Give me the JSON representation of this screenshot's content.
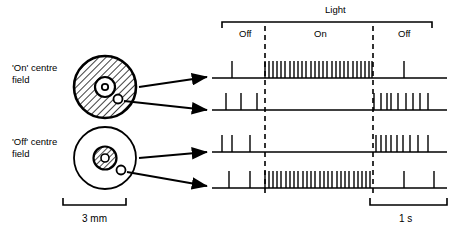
{
  "figure": {
    "title_label": "Light",
    "phases": [
      {
        "name": "off-before",
        "label": "Off",
        "x_start": 222,
        "x_end": 265
      },
      {
        "name": "on",
        "label": "On",
        "x_start": 265,
        "x_end": 373
      },
      {
        "name": "off-after",
        "label": "Off",
        "x_start": 373,
        "x_end": 432
      }
    ],
    "receptive_fields": [
      {
        "name": "on-centre",
        "label": "'On' centre\nfield",
        "centre_type": "on",
        "cx": 105,
        "cy": 87,
        "outer_r": 31,
        "inner_r": 10,
        "surround_fill": "hatched",
        "centre_fill": "white",
        "electrode_dot": {
          "cx": 118,
          "cy": 99,
          "r": 4.5
        }
      },
      {
        "name": "off-centre",
        "label": "'Off' centre\nfield",
        "centre_type": "off",
        "cx": 105,
        "cy": 158,
        "outer_r": 31,
        "inner_r": 11,
        "surround_fill": "white",
        "centre_fill": "hatched",
        "electrode_dot": {
          "cx": 121,
          "cy": 170,
          "r": 4.5
        }
      }
    ],
    "scale_bars": [
      {
        "name": "spatial-scale",
        "label": "3 mm",
        "x1": 63,
        "x2": 126,
        "y": 205
      },
      {
        "name": "time-scale",
        "label": "1 s",
        "x1": 370,
        "x2": 447,
        "y": 205
      }
    ],
    "traces": [
      {
        "name": "trace-on-centre",
        "source_field": "on-centre",
        "description": "On-centre cell, centre illumination: burst during On",
        "baseline_y": 78,
        "spike_height": 17,
        "spikes": [
          232,
          265,
          269,
          273,
          277,
          281,
          285,
          290,
          294,
          298,
          302,
          306,
          311,
          315,
          319,
          323,
          327,
          332,
          336,
          340,
          344,
          348,
          353,
          357,
          361,
          365,
          369,
          372,
          404
        ]
      },
      {
        "name": "trace-on-surround",
        "source_field": "on-centre",
        "description": "On-centre cell, surround illumination: silenced during On, burst at Off",
        "baseline_y": 110,
        "spike_height": 17,
        "spikes": [
          226,
          241,
          257,
          374,
          381,
          387,
          391,
          398,
          406,
          413,
          420,
          428
        ]
      },
      {
        "name": "trace-off-centre",
        "source_field": "off-centre",
        "description": "Off-centre cell, centre illumination: silenced during On, burst at Off",
        "baseline_y": 152,
        "spike_height": 17,
        "spikes": [
          222,
          232,
          250,
          376,
          381,
          386,
          391,
          397,
          403,
          410,
          418,
          428
        ]
      },
      {
        "name": "trace-off-surround",
        "source_field": "off-centre",
        "description": "Off-centre cell, surround illumination: burst during On",
        "baseline_y": 188,
        "spike_height": 17,
        "spikes": [
          229,
          250,
          265,
          269,
          273,
          277,
          281,
          286,
          290,
          294,
          298,
          303,
          307,
          311,
          315,
          320,
          324,
          328,
          332,
          337,
          341,
          345,
          349,
          354,
          358,
          362,
          366,
          370,
          404,
          434
        ]
      }
    ],
    "dashed_markers": [
      {
        "name": "light-on-marker",
        "x": 265,
        "y1": 26,
        "y2": 196
      },
      {
        "name": "light-off-marker",
        "x": 373,
        "y1": 26,
        "y2": 196
      }
    ],
    "bracket": {
      "name": "light-bracket",
      "x1": 222,
      "x2": 432,
      "y": 22,
      "tick": 6
    },
    "arrows": [
      {
        "name": "arrow-on-centre-to-trace1",
        "x1": 139,
        "y1": 87,
        "x2": 207,
        "y2": 77
      },
      {
        "name": "arrow-on-surround-to-trace2",
        "x1": 124,
        "y1": 101,
        "x2": 207,
        "y2": 110
      },
      {
        "name": "arrow-off-centre-to-trace3",
        "x1": 139,
        "y1": 158,
        "x2": 207,
        "y2": 152
      },
      {
        "name": "arrow-off-surround-to-trace4",
        "x1": 127,
        "y1": 172,
        "x2": 207,
        "y2": 186
      }
    ],
    "colors": {
      "ink": "#000000",
      "background": "#ffffff"
    }
  }
}
